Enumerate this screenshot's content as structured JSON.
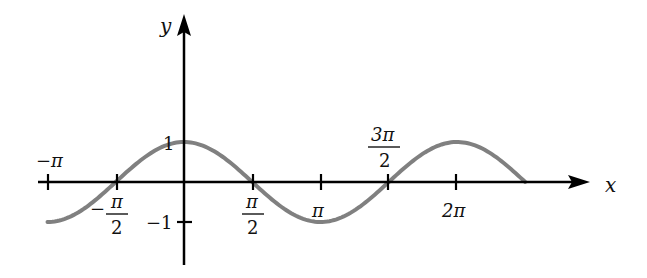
{
  "chart_data": {
    "type": "line",
    "title": "",
    "xlabel": "x",
    "ylabel": "y",
    "function": "y = cos(x)",
    "xlim": [
      -3.14159,
      7.85398
    ],
    "ylim": [
      -1,
      1
    ],
    "grid": false,
    "legend": null,
    "x_ticks": [
      {
        "value": -3.14159,
        "label": "−π"
      },
      {
        "value": -1.5708,
        "label_num": "π",
        "label_den": "2",
        "sign": "−"
      },
      {
        "value": 1.5708,
        "label_num": "π",
        "label_den": "2",
        "sign": ""
      },
      {
        "value": 3.14159,
        "label": "π"
      },
      {
        "value": 4.71239,
        "label_num": "3π",
        "label_den": "2",
        "sign": ""
      },
      {
        "value": 6.28319,
        "label": "2π"
      }
    ],
    "y_ticks": [
      {
        "value": 1,
        "label": "1"
      },
      {
        "value": -1,
        "label": "−1"
      }
    ],
    "series": [
      {
        "name": "cos(x)",
        "color": "#808080",
        "x": [
          -3.14159,
          -2.35619,
          -1.5708,
          -0.7854,
          0,
          0.7854,
          1.5708,
          2.35619,
          3.14159,
          3.92699,
          4.71239,
          5.49779,
          6.28319,
          7.06858,
          7.85398
        ],
        "values": [
          -1,
          -0.707,
          0,
          0.707,
          1,
          0.707,
          0,
          -0.707,
          -1,
          -0.707,
          0,
          0.707,
          1,
          0.707,
          0
        ]
      }
    ],
    "colors": {
      "axis": "#000000",
      "curve": "#808080"
    }
  },
  "labels": {
    "x_axis": "x",
    "y_axis": "y",
    "neg_pi": "−π",
    "neg_half_pi_sign": "−",
    "neg_half_pi_num": "π",
    "neg_half_pi_den": "2",
    "half_pi_num": "π",
    "half_pi_den": "2",
    "pi": "π",
    "three_half_pi_num": "3π",
    "three_half_pi_den": "2",
    "two_pi": "2π",
    "y_one": "1",
    "y_neg_one": "−1"
  }
}
